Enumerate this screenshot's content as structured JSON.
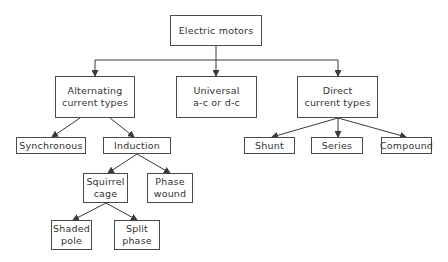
{
  "diagram": {
    "nodes": [
      {
        "id": "root",
        "lines": [
          "Electric motors"
        ]
      },
      {
        "id": "ac",
        "lines": [
          "Alternating",
          "current types"
        ]
      },
      {
        "id": "universal",
        "lines": [
          "Universal",
          "a-c or d-c"
        ]
      },
      {
        "id": "dc",
        "lines": [
          "Direct",
          "current types"
        ]
      },
      {
        "id": "synchronous",
        "lines": [
          "Synchronous"
        ]
      },
      {
        "id": "induction",
        "lines": [
          "Induction"
        ]
      },
      {
        "id": "shunt",
        "lines": [
          "Shunt"
        ]
      },
      {
        "id": "series",
        "lines": [
          "Series"
        ]
      },
      {
        "id": "compound",
        "lines": [
          "Compound"
        ]
      },
      {
        "id": "squirrel",
        "lines": [
          "Squirrel",
          "cage"
        ]
      },
      {
        "id": "phase_wound",
        "lines": [
          "Phase",
          "wound"
        ]
      },
      {
        "id": "shaded",
        "lines": [
          "Shaded",
          "pole"
        ]
      },
      {
        "id": "split",
        "lines": [
          "Split",
          "phase"
        ]
      }
    ],
    "edges": [
      [
        "root",
        "ac"
      ],
      [
        "root",
        "universal"
      ],
      [
        "root",
        "dc"
      ],
      [
        "ac",
        "synchronous"
      ],
      [
        "ac",
        "induction"
      ],
      [
        "dc",
        "shunt"
      ],
      [
        "dc",
        "series"
      ],
      [
        "dc",
        "compound"
      ],
      [
        "induction",
        "squirrel"
      ],
      [
        "induction",
        "phase_wound"
      ],
      [
        "squirrel",
        "shaded"
      ],
      [
        "squirrel",
        "split"
      ]
    ],
    "colors": {
      "line": "#3a3a3a",
      "border": "#4a4a4a",
      "text": "#333333",
      "background": "#ffffff"
    }
  }
}
